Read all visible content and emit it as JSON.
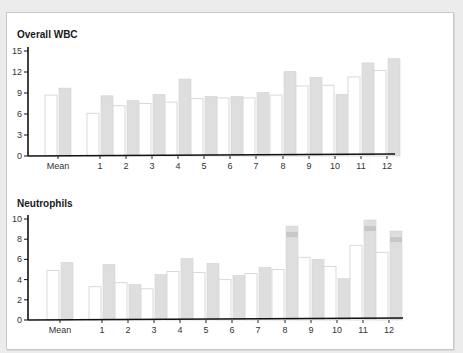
{
  "chart_data": [
    {
      "type": "bar",
      "title": "Overall WBC",
      "xlabel": "",
      "ylabel": "",
      "ylim": [
        0,
        15
      ],
      "yticks": [
        0,
        3,
        6,
        9,
        12,
        15
      ],
      "grid": false,
      "legend": null,
      "categories": [
        "Mean",
        "1",
        "2",
        "3",
        "4",
        "5",
        "6",
        "7",
        "8",
        "9",
        "10",
        "11",
        "12"
      ],
      "series": [
        {
          "name": "series-white",
          "color": "#ffffff",
          "values": [
            8.7,
            6.1,
            7.2,
            7.5,
            7.7,
            8.2,
            8.3,
            8.3,
            8.7,
            10.0,
            10.1,
            11.3,
            12.2
          ]
        },
        {
          "name": "series-grey",
          "color": "#dcdcdc",
          "values": [
            9.7,
            8.6,
            7.9,
            8.8,
            11.0,
            8.5,
            8.5,
            9.1,
            12.1,
            11.2,
            8.8,
            13.3,
            13.9
          ]
        }
      ]
    },
    {
      "type": "bar",
      "title": "Neutrophils",
      "xlabel": "",
      "ylabel": "",
      "ylim": [
        0,
        10
      ],
      "yticks": [
        0,
        2,
        4,
        6,
        8,
        10
      ],
      "grid": false,
      "legend": null,
      "categories": [
        "Mean",
        "1",
        "2",
        "3",
        "4",
        "5",
        "6",
        "7",
        "8",
        "9",
        "10",
        "11",
        "12"
      ],
      "series": [
        {
          "name": "series-white",
          "color": "#ffffff",
          "values": [
            4.9,
            3.3,
            3.7,
            3.1,
            4.8,
            4.7,
            4.0,
            4.6,
            5.0,
            6.2,
            5.3,
            7.4,
            6.7
          ]
        },
        {
          "name": "series-grey",
          "color": "#dcdcdc",
          "values": [
            5.7,
            5.5,
            3.5,
            4.5,
            6.1,
            5.6,
            4.4,
            5.2,
            9.3,
            6.0,
            4.1,
            9.9,
            8.8
          ]
        }
      ],
      "annotations": [
        "Bars 8, 11 and 12 (grey) show a darker highlighted band near the top"
      ]
    }
  ]
}
